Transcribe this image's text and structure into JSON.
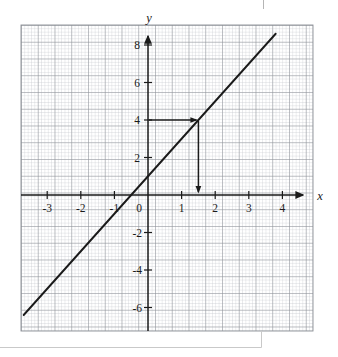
{
  "figure": {
    "kind": "coordinate-grid-line-graph",
    "background_color": "#ffffff",
    "grid": {
      "minor_color": "#b9bcc2",
      "major_color": "#8f9399",
      "minor_step_px": 3.35,
      "major_every": 5,
      "left_px": 21,
      "top_px": 25,
      "right_px": 313,
      "bottom_px": 331
    },
    "axes": {
      "color": "#1a1a1a",
      "origin_px": {
        "x": 148,
        "y": 195
      },
      "x_unit_px": 33.6,
      "y_unit_px": 18.75,
      "x_label": "x",
      "y_label": "y",
      "x_axis_from_px": 21,
      "x_axis_to_px": 306,
      "y_axis_from_px": 331,
      "y_axis_to_px": 33
    },
    "x_ticks": [
      {
        "label": "-3",
        "value": -3
      },
      {
        "label": "-2",
        "value": -2
      },
      {
        "label": "-1",
        "value": -1
      },
      {
        "label": "0",
        "value": 0
      },
      {
        "label": "1",
        "value": 1
      },
      {
        "label": "2",
        "value": 2
      },
      {
        "label": "3",
        "value": 3
      },
      {
        "label": "4",
        "value": 4
      }
    ],
    "y_ticks": [
      {
        "label": "8",
        "value": 8
      },
      {
        "label": "6",
        "value": 6
      },
      {
        "label": "4",
        "value": 4
      },
      {
        "label": "2",
        "value": 2
      },
      {
        "label": "-2",
        "value": -2
      },
      {
        "label": "-4",
        "value": -4
      },
      {
        "label": "-6",
        "value": -6
      }
    ],
    "origin_label": "0"
  },
  "chart_data": {
    "type": "line",
    "title": "",
    "xlabel": "x",
    "ylabel": "y",
    "xlim": [
      -3.75,
      4.75
    ],
    "ylim": [
      -7.2,
      8.7
    ],
    "grid": true,
    "legend": "none",
    "series": [
      {
        "name": "line",
        "equation": "y = 2x + 1",
        "slope": 2,
        "intercept": 1,
        "color": "#1a1a1a",
        "x": [
          -3.7,
          3.8
        ],
        "y": [
          -6.4,
          8.6
        ],
        "points": [
          {
            "x": -3.7,
            "y": -6.4
          },
          {
            "x": 3.8,
            "y": 8.6
          }
        ]
      }
    ],
    "annotations": [
      {
        "name": "read-off-arrow",
        "type": "arrow-path",
        "description": "Horizontal arrow from y-axis at y=4 rightward to the line, then vertical arrow down to the x-axis at x=1.5",
        "from": {
          "x": 0,
          "y": 4
        },
        "elbow": {
          "x": 1.5,
          "y": 4
        },
        "to": {
          "x": 1.5,
          "y": 0
        },
        "color": "#1a1a1a"
      }
    ]
  },
  "scan_artifacts": {
    "bottom_edge_color": "#c9c9c9",
    "top_tick_mark": true
  }
}
